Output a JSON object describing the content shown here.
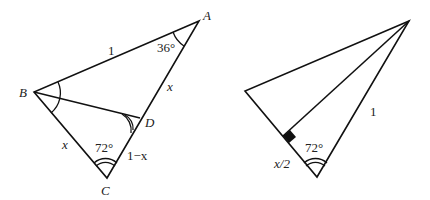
{
  "figure": {
    "left_triangle": {
      "vertices": {
        "A": "A",
        "B": "B",
        "C": "C",
        "D": "D"
      },
      "side_labels": {
        "AB": "1",
        "AD": "x",
        "BC": "x",
        "DC": "1−x"
      },
      "angle_labels": {
        "A": "36°",
        "C": "72°"
      }
    },
    "right_triangle": {
      "side_labels": {
        "right_side": "1",
        "base_half": "x/2"
      },
      "angle_labels": {
        "bottom": "72°"
      }
    }
  }
}
